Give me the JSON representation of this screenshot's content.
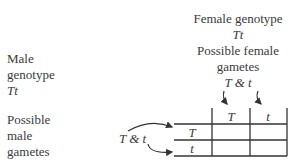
{
  "female": {
    "genotype_label": "Female genotype",
    "genotype": "Tt",
    "gametes_label_line1": "Possible female",
    "gametes_label_line2": "gametes",
    "gametes": "T & t"
  },
  "male": {
    "genotype_label_line1": "Male",
    "genotype_label_line2": "genotype",
    "genotype": "Tt",
    "gametes_label_line1": "Possible",
    "gametes_label_line2": "male",
    "gametes_label_line3": "gametes",
    "gametes": "T & t"
  },
  "punnett": {
    "column_headers": [
      "T",
      "t"
    ],
    "row_headers": [
      "T",
      "t"
    ],
    "cells": [
      [
        "",
        ""
      ],
      [
        "",
        ""
      ]
    ]
  }
}
